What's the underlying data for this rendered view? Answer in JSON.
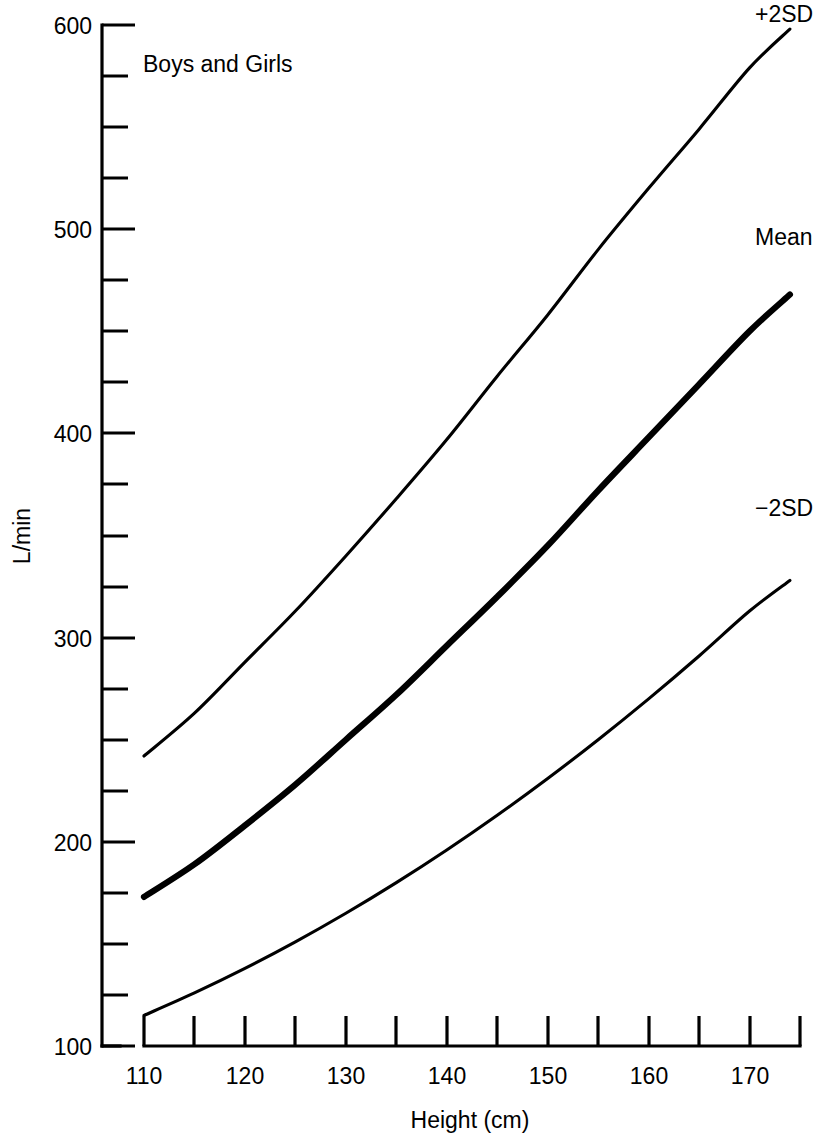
{
  "chart_data": {
    "type": "line",
    "title": "",
    "annotation": "Boys and Girls",
    "xlabel": "Height (cm)",
    "ylabel": "L/min",
    "xlim": [
      110,
      175
    ],
    "ylim": [
      100,
      600
    ],
    "grid": false,
    "legend_position": "right-inline-labels",
    "x_major_ticks": [
      110,
      120,
      130,
      140,
      150,
      160,
      170
    ],
    "x_minor_ticks": [
      115,
      125,
      135,
      145,
      155,
      165,
      175
    ],
    "x_tick_labels": [
      "110",
      "120",
      "130",
      "140",
      "150",
      "160",
      "170"
    ],
    "y_major_ticks": [
      100,
      200,
      300,
      400,
      500,
      600
    ],
    "y_minor_ticks": [
      125,
      150,
      175,
      225,
      250,
      275,
      325,
      350,
      375,
      425,
      450,
      475,
      525,
      550,
      575
    ],
    "y_tick_labels": [
      "100",
      "200",
      "300",
      "400",
      "500",
      "600"
    ],
    "x": [
      110,
      115,
      120,
      125,
      130,
      135,
      140,
      145,
      150,
      155,
      160,
      165,
      170,
      174
    ],
    "series": [
      {
        "name": "+2SD",
        "label": "+2SD",
        "style": "thin",
        "values": [
          242,
          263,
          288,
          313,
          340,
          368,
          397,
          428,
          458,
          490,
          520,
          549,
          579,
          598
        ]
      },
      {
        "name": "Mean",
        "label": "Mean",
        "style": "thick",
        "values": [
          173,
          189,
          208,
          228,
          250,
          272,
          296,
          320,
          345,
          372,
          398,
          424,
          450,
          468
        ]
      },
      {
        "name": "-2SD",
        "label": "−2SD",
        "style": "thin",
        "values": [
          115,
          126,
          138,
          151,
          165,
          180,
          196,
          213,
          231,
          250,
          270,
          291,
          313,
          328
        ]
      }
    ],
    "series_end_values": {
      "plus2sd": 598,
      "mean": 489,
      "minus2sd": 357
    },
    "colors": {
      "line": "#000000",
      "axis": "#000000",
      "background": "#ffffff"
    }
  }
}
